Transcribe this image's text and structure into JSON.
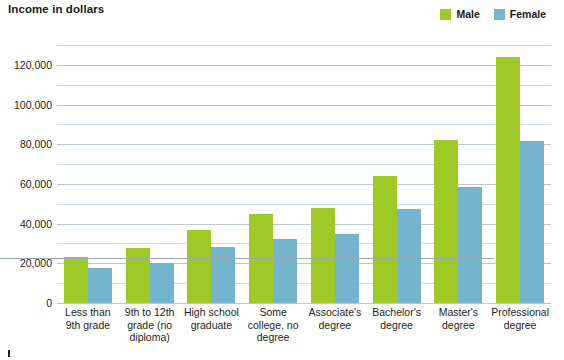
{
  "chart_data": {
    "type": "bar",
    "title": "Income in dollars",
    "xlabel": "",
    "ylabel": "Income in dollars",
    "ylim": [
      0,
      130000
    ],
    "grid": true,
    "grid_major_step": 20000,
    "grid_minor_step": 10000,
    "legend_position": "top-right",
    "categories": [
      "Less than 9th grade",
      "9th to 12th grade (no diploma)",
      "High school graduate",
      "Some college, no degree",
      "Associate's degree",
      "Bachelor's degree",
      "Master's degree",
      "Professional degree"
    ],
    "category_lines": [
      [
        "Less than",
        "9th grade"
      ],
      [
        "9th to 12th",
        "grade (no",
        "diploma)"
      ],
      [
        "High school",
        "graduate"
      ],
      [
        "Some",
        "college, no",
        "degree"
      ],
      [
        "Associate's",
        "degree"
      ],
      [
        "Bachelor's",
        "degree"
      ],
      [
        "Master's",
        "degree"
      ],
      [
        "Professional",
        "degree"
      ]
    ],
    "tick_labels": [
      "0",
      "20,000",
      "40,000",
      "60,000",
      "80,000",
      "100,000",
      "120,000"
    ],
    "tick_values": [
      0,
      20000,
      40000,
      60000,
      80000,
      100000,
      120000
    ],
    "series": [
      {
        "name": "Male",
        "color": "#9fc926",
        "values": [
          23000,
          27500,
          37000,
          45000,
          48000,
          64000,
          82000,
          124000
        ]
      },
      {
        "name": "Female",
        "color": "#74b4cc",
        "values": [
          17500,
          20000,
          28000,
          32500,
          35000,
          47500,
          58500,
          81500
        ]
      }
    ]
  },
  "legend": {
    "items": [
      {
        "label": "Male",
        "color": "#9fc926"
      },
      {
        "label": "Female",
        "color": "#74b4cc"
      }
    ]
  },
  "colors": {
    "male": "#9fc926",
    "female": "#74b4cc",
    "gridline_major": "#b9c7d9",
    "gridline_minor": "#cdd8e5",
    "axis": "#9aa7b5",
    "text": "#231f20",
    "background": "#ffffff"
  }
}
